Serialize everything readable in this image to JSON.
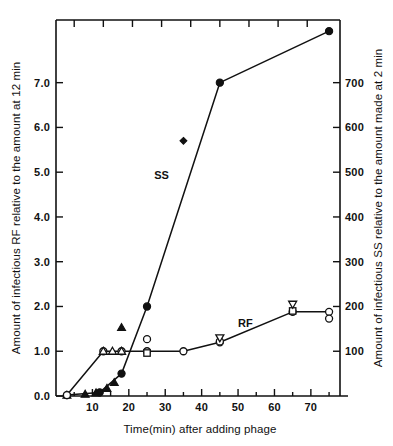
{
  "chart_data": {
    "type": "line",
    "title": "",
    "subtitle": "",
    "xlabel": "Time(min) after adding phage",
    "ylabel": "Amount of infectious RF relative to the amount at 12 min",
    "ylabel_right": "Amount of infectious SS relative to the amount made at 2 min",
    "xlim": [
      0,
      78
    ],
    "ylim": [
      0,
      8.4
    ],
    "ylim_right": [
      0,
      840
    ],
    "grid": false,
    "legend_position": "inline-annotations",
    "xticks": [
      10,
      20,
      30,
      40,
      50,
      60,
      70
    ],
    "xticklabels": [
      "10",
      "20",
      "30",
      "40",
      "50",
      "60",
      "70"
    ],
    "xminorticks": [
      5,
      15,
      25,
      35,
      45,
      55,
      65,
      75
    ],
    "yticks": [
      0.0,
      1.0,
      2.0,
      3.0,
      4.0,
      5.0,
      6.0,
      7.0
    ],
    "yticklabels": [
      "0.0",
      "1.0",
      "2.0",
      "3.0",
      "4.0",
      "5.0",
      "6.0",
      "7.0"
    ],
    "yticks_right": [
      100,
      200,
      300,
      400,
      500,
      600,
      700
    ],
    "yticklabels_right": [
      "100",
      "200",
      "300",
      "400",
      "500",
      "600",
      "700"
    ],
    "top_axis_ticks": [
      5,
      13,
      21,
      29,
      37,
      45,
      53,
      61,
      69
    ],
    "annotations": [
      {
        "text": "SS",
        "x": 29,
        "y": 4.85
      },
      {
        "text": "RF",
        "x": 52,
        "y": 1.55
      }
    ],
    "series": [
      {
        "name": "SS",
        "marker": "filled-circle",
        "axis": "right",
        "line": true,
        "x": [
          3,
          12,
          18,
          25,
          45,
          75
        ],
        "values": [
          0.02,
          0.08,
          0.5,
          2.0,
          7.0,
          8.15
        ]
      },
      {
        "name": "SS-triangles",
        "marker": "filled-triangle-up",
        "axis": "right",
        "line": false,
        "x": [
          3,
          8,
          11,
          14,
          16,
          18
        ],
        "values": [
          0.02,
          0.04,
          0.07,
          0.17,
          0.3,
          1.53
        ]
      },
      {
        "name": "SS-diamond",
        "marker": "filled-diamond",
        "axis": "right",
        "line": false,
        "x": [
          35
        ],
        "values": [
          5.7
        ]
      },
      {
        "name": "RF",
        "marker": "open-circle",
        "axis": "left",
        "line": true,
        "x": [
          3,
          13,
          18,
          25,
          35,
          45,
          65,
          75
        ],
        "values": [
          0.02,
          1.0,
          1.0,
          1.0,
          1.0,
          1.2,
          1.88,
          1.88
        ]
      },
      {
        "name": "RF-open-triangle-up",
        "marker": "open-triangle-up",
        "axis": "left",
        "line": false,
        "x": [
          13,
          15.5,
          18
        ],
        "values": [
          1.0,
          1.0,
          1.0
        ]
      },
      {
        "name": "RF-open-squares",
        "marker": "open-square",
        "axis": "left",
        "line": false,
        "x": [
          25,
          65
        ],
        "values": [
          0.96,
          1.9
        ]
      },
      {
        "name": "RF-open-circles-extra",
        "marker": "open-circle",
        "axis": "left",
        "line": false,
        "x": [
          25,
          45,
          75
        ],
        "values": [
          1.27,
          1.22,
          1.73
        ]
      },
      {
        "name": "RF-open-triangle-down",
        "marker": "open-triangle-down",
        "axis": "left",
        "line": false,
        "x": [
          45,
          65
        ],
        "values": [
          1.3,
          2.05
        ]
      }
    ]
  },
  "figure": {
    "background_color": "#ffffff",
    "ink_color": "#111111"
  }
}
